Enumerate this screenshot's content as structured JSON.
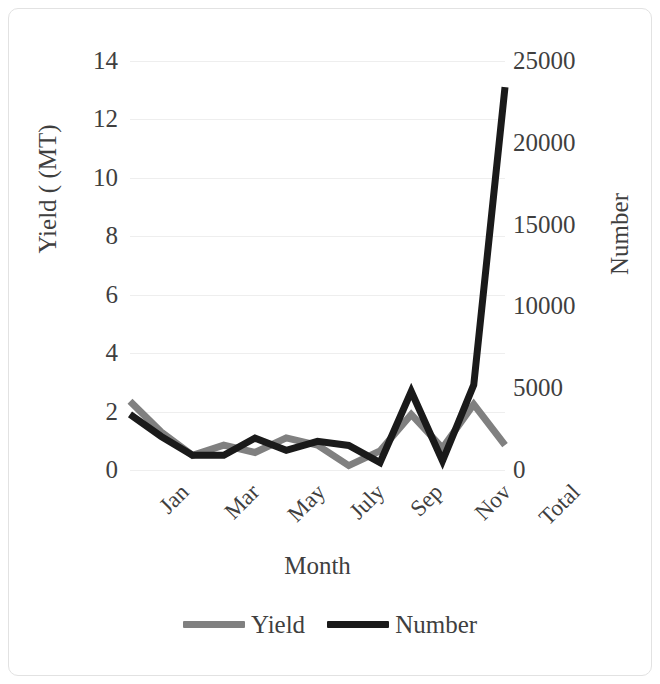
{
  "chart_data": {
    "type": "line",
    "title": "",
    "xlabel": "Month",
    "ylabel": "Yield ( (MT)",
    "y2label": "Number",
    "grid": true,
    "legend_position": "bottom",
    "categories": [
      "Jan",
      "Feb",
      "Mar",
      "Apr",
      "May",
      "June",
      "July",
      "Aug",
      "Sep",
      "Oct",
      "Nov",
      "Dec",
      "Total"
    ],
    "xtick_labels": [
      "Jan",
      "Mar",
      "May",
      "July",
      "Sep",
      "Nov",
      "Total"
    ],
    "ytick_labels": [
      "0",
      "2",
      "4",
      "6",
      "8",
      "10",
      "12",
      "14"
    ],
    "ytick_values": [
      0,
      2,
      4,
      6,
      8,
      10,
      12,
      14
    ],
    "ylim": [
      0,
      14
    ],
    "y2tick_labels": [
      "0",
      "5000",
      "10000",
      "15000",
      "20000",
      "25000"
    ],
    "y2tick_values": [
      0,
      5000,
      10000,
      15000,
      20000,
      25000
    ],
    "y2lim": [
      0,
      25000
    ],
    "series": [
      {
        "name": "Yield",
        "axis": "left",
        "color": "#808080",
        "values": [
          2.35,
          1.3,
          0.5,
          0.85,
          0.6,
          1.1,
          0.85,
          0.15,
          0.65,
          1.9,
          0.75,
          2.25,
          0.85
        ]
      },
      {
        "name": "Number",
        "axis": "right",
        "color": "#1a1a1a",
        "values": [
          3400,
          2050,
          900,
          900,
          1950,
          1200,
          1750,
          1500,
          450,
          4800,
          550,
          5200,
          23400
        ]
      }
    ]
  },
  "legend": {
    "entries": [
      {
        "label": "Yield",
        "color": "#808080"
      },
      {
        "label": "Number",
        "color": "#1a1a1a"
      }
    ]
  }
}
